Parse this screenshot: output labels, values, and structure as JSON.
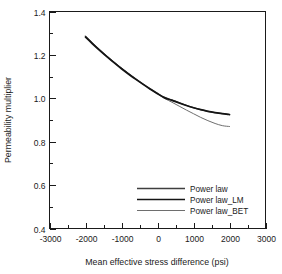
{
  "chart_data": {
    "type": "line",
    "title": "",
    "xlabel": "Mean effective stress difference (psi)",
    "ylabel": "Permeability multiplier",
    "xlim": [
      -3000,
      3000
    ],
    "ylim": [
      0.4,
      1.4
    ],
    "xticks": [
      -3000,
      -2000,
      -1000,
      0,
      1000,
      2000,
      3000
    ],
    "xticklabels": [
      "-3000",
      "-2000",
      "-1000",
      "0",
      "1000",
      "2000",
      "3000"
    ],
    "yticks": [
      0.4,
      0.6,
      0.8,
      1.0,
      1.2,
      1.4
    ],
    "yticklabels": [
      "0.4",
      "0.6",
      "0.8",
      "1.0",
      "1.2",
      "1.4"
    ],
    "x_minor_step": 500,
    "y_minor_step": 0.1,
    "grid": false,
    "legend_position": "lower-right",
    "x": [
      -2000,
      -1800,
      -1600,
      -1400,
      -1200,
      -1000,
      -800,
      -600,
      -400,
      -200,
      0,
      200,
      400,
      600,
      800,
      1000,
      1200,
      1400,
      1600,
      1800,
      2000
    ],
    "series": [
      {
        "name": "Power law",
        "color": "#3f3f3f",
        "width": 1.3,
        "values": [
          1.285,
          1.253,
          1.222,
          1.193,
          1.165,
          1.138,
          1.113,
          1.089,
          1.066,
          1.044,
          1.023,
          1.004,
          0.9925,
          0.98,
          0.968,
          0.957,
          0.948,
          0.94,
          0.934,
          0.929,
          0.925
        ]
      },
      {
        "name": "Power law_LM",
        "color": "#141414",
        "width": 1.7,
        "values": [
          1.282,
          1.25,
          1.22,
          1.191,
          1.163,
          1.136,
          1.111,
          1.087,
          1.064,
          1.042,
          1.021,
          1.002,
          0.9905,
          0.9785,
          0.967,
          0.9565,
          0.9475,
          0.94,
          0.934,
          0.929,
          0.9252
        ]
      },
      {
        "name": "Power law_BET",
        "color": "#6e6e6e",
        "width": 1.0,
        "values": [
          1.288,
          1.255,
          1.224,
          1.194,
          1.166,
          1.139,
          1.113,
          1.089,
          1.065,
          1.042,
          1.02,
          0.999,
          0.982,
          0.964,
          0.946,
          0.929,
          0.912,
          0.897,
          0.884,
          0.874,
          0.87
        ]
      }
    ]
  },
  "legend": {
    "items": [
      {
        "label": "Power law"
      },
      {
        "label": "Power law_LM"
      },
      {
        "label": "Power law_BET"
      }
    ]
  }
}
